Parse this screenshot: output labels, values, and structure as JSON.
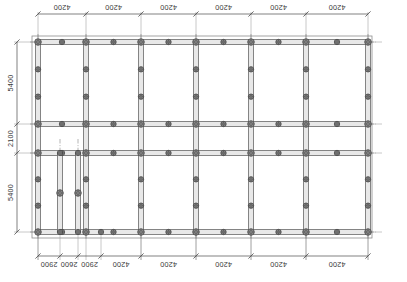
{
  "drawing": {
    "type": "structural-framing-plan",
    "title": "Column and Beam Framing Plan",
    "units": "mm",
    "background_color": "#ffffff",
    "line_color": "#4a4a4a",
    "column_fill": "#8a8a8a",
    "beam_fill": "#e8e8e8",
    "centerline_color": "#6a6a6a"
  },
  "dimensions": {
    "top": {
      "label_rotation": 180,
      "segments": [
        {
          "value": "4200"
        },
        {
          "value": "4200"
        },
        {
          "value": "4200"
        },
        {
          "value": "4200"
        },
        {
          "value": "4200"
        },
        {
          "value": "4200"
        }
      ]
    },
    "bottom": {
      "label_rotation": 180,
      "segments": [
        {
          "value": "2900"
        },
        {
          "value": "2600"
        },
        {
          "value": "2900"
        },
        {
          "value": "4200"
        },
        {
          "value": "4200"
        },
        {
          "value": "4200"
        },
        {
          "value": "4200"
        },
        {
          "value": "4200"
        }
      ]
    },
    "left": {
      "label_rotation": -90,
      "segments": [
        {
          "value": "5400"
        },
        {
          "value": "2100"
        },
        {
          "value": "5400"
        }
      ]
    }
  },
  "geometry": {
    "outline": {
      "x": 32,
      "y": 36,
      "width": 340,
      "height": 202
    },
    "grid_x": [
      38,
      86,
      141,
      196,
      251,
      306,
      368
    ],
    "grid_y": [
      42,
      124,
      153,
      232
    ],
    "sub_grid_x_bottom": [
      38,
      60,
      78,
      101,
      141,
      196,
      251,
      306,
      368
    ],
    "beam_half_width": 2.6,
    "column_radius": 3.3,
    "stub_column_radius": 2.7,
    "extra_verticals": [
      {
        "x": 60,
        "y1": 153,
        "y2": 232,
        "mid_column_y": 193
      },
      {
        "x": 78,
        "y1": 153,
        "y2": 232,
        "mid_column_y": 193
      }
    ]
  },
  "labels": {
    "top_dim_row_y": 14,
    "bottom_dim_row_y": 256,
    "left_dim_col_x": 17
  }
}
